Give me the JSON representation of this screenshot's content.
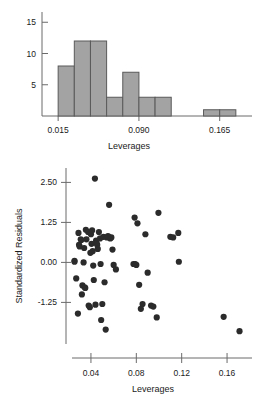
{
  "figure": {
    "background": "#ffffff",
    "ink_color": "#1a1a1a",
    "axis_color": "#6b6b6b"
  },
  "chart_data": [
    {
      "id": "leverages-histogram",
      "type": "bar",
      "title": "",
      "xlabel": "Leverages",
      "ylabel": "",
      "grid": false,
      "legend": null,
      "bar_fill": "#a3a3a3",
      "bar_stroke": "#5a5a5a",
      "xlim": [
        0.0,
        0.195
      ],
      "ylim": [
        0,
        16
      ],
      "xticks": [
        0.015,
        0.09,
        0.165
      ],
      "xtick_labels": [
        "0.015",
        "0.090",
        "0.165"
      ],
      "yticks": [
        5,
        10,
        15
      ],
      "ytick_labels": [
        "5",
        "10",
        "15"
      ],
      "bin_width": 0.015,
      "bin_edges": [
        0.015,
        0.03,
        0.045,
        0.06,
        0.075,
        0.09,
        0.105,
        0.12,
        0.135,
        0.15,
        0.165,
        0.18
      ],
      "categories": [
        "0.015-0.030",
        "0.030-0.045",
        "0.045-0.060",
        "0.060-0.075",
        "0.075-0.090",
        "0.090-0.105",
        "0.105-0.120",
        "0.120-0.135",
        "0.135-0.150",
        "0.150-0.165",
        "0.165-0.180"
      ],
      "values": [
        8,
        12,
        12,
        3,
        7,
        3,
        3,
        0,
        0,
        1,
        1
      ]
    },
    {
      "id": "residuals-vs-leverages-scatter",
      "type": "scatter",
      "title": "",
      "xlabel": "Leverages",
      "ylabel": "Standardized Residuals",
      "grid": false,
      "legend": null,
      "point_color": "#2b2b2b",
      "point_size": 3.1,
      "xlim": [
        0.018,
        0.182
      ],
      "ylim": [
        -2.55,
        2.95
      ],
      "xticks": [
        0.04,
        0.08,
        0.12,
        0.16
      ],
      "xtick_labels": [
        "0.04",
        "0.08",
        "0.12",
        "0.16"
      ],
      "yticks": [
        -1.25,
        0.0,
        1.25,
        2.5
      ],
      "ytick_labels": [
        "-1.25",
        "0.00",
        "1.25",
        "2.50"
      ],
      "x": [
        0.0255,
        0.0255,
        0.027,
        0.0285,
        0.029,
        0.0295,
        0.03,
        0.031,
        0.0315,
        0.032,
        0.0325,
        0.0335,
        0.034,
        0.0345,
        0.035,
        0.0355,
        0.036,
        0.0375,
        0.038,
        0.039,
        0.0395,
        0.04,
        0.0405,
        0.041,
        0.0415,
        0.042,
        0.0425,
        0.0435,
        0.044,
        0.0445,
        0.045,
        0.0455,
        0.046,
        0.047,
        0.048,
        0.0485,
        0.049,
        0.05,
        0.051,
        0.052,
        0.053,
        0.054,
        0.055,
        0.0555,
        0.056,
        0.057,
        0.058,
        0.059,
        0.06,
        0.062,
        0.0775,
        0.0785,
        0.079,
        0.08,
        0.081,
        0.0825,
        0.084,
        0.0855,
        0.088,
        0.09,
        0.093,
        0.095,
        0.098,
        0.0995,
        0.11,
        0.1125,
        0.117,
        0.1175,
        0.157,
        0.171
      ],
      "y": [
        0.05,
        0.02,
        -0.5,
        -1.6,
        0.92,
        0.55,
        0.5,
        0.72,
        0.7,
        -1.0,
        -0.72,
        0.0,
        0.45,
        -0.78,
        -0.8,
        1.02,
        0.72,
        0.95,
        -1.35,
        -1.4,
        0.3,
        0.88,
        0.58,
        1.0,
        0.35,
        -0.1,
        -0.55,
        2.62,
        -1.32,
        0.68,
        0.6,
        0.55,
        0.42,
        0.95,
        0.75,
        -0.05,
        -1.8,
        -1.3,
        0.8,
        -0.62,
        -2.1,
        0.78,
        0.82,
        0.8,
        1.8,
        0.75,
        0.78,
        0.4,
        -0.08,
        -0.22,
        -0.05,
        1.4,
        -0.05,
        -0.08,
        1.22,
        -0.7,
        -1.45,
        -1.3,
        0.88,
        -0.32,
        -1.35,
        -1.38,
        -1.72,
        1.55,
        0.8,
        0.78,
        0.92,
        0.02,
        -1.7,
        -2.15
      ]
    }
  ]
}
